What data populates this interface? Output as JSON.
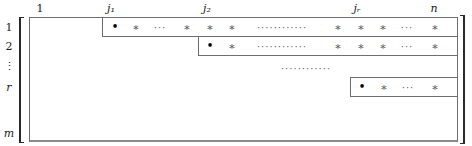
{
  "diagram": {
    "type": "row-echelon-form-matrix",
    "column_labels": [
      {
        "text": "1",
        "x": 40
      },
      {
        "text": "j₁",
        "x": 111
      },
      {
        "text": "j₂",
        "x": 207
      },
      {
        "text": "jᵣ",
        "x": 357
      },
      {
        "text": "n",
        "x": 434
      }
    ],
    "row_labels": [
      {
        "text": "1",
        "y": 27
      },
      {
        "text": "2",
        "y": 46
      },
      {
        "text": "⋮",
        "y": 66
      },
      {
        "text": "r",
        "y": 87
      },
      {
        "text": "m",
        "y": 133
      }
    ],
    "rows": [
      {
        "name": "row-1",
        "box": {
          "x": 102,
          "y": 17,
          "w": 355,
          "h": 19
        },
        "cells": [
          {
            "kind": "pivot",
            "text": "•",
            "x": 115
          },
          {
            "kind": "star",
            "text": "∗",
            "x": 136
          },
          {
            "kind": "dots",
            "text": "···",
            "x": 160
          },
          {
            "kind": "star",
            "text": "∗",
            "x": 187
          },
          {
            "kind": "star",
            "text": "∗",
            "x": 210
          },
          {
            "kind": "star",
            "text": "∗",
            "x": 232
          },
          {
            "kind": "dots",
            "text": "············",
            "x": 282
          },
          {
            "kind": "star",
            "text": "∗",
            "x": 338
          },
          {
            "kind": "star",
            "text": "∗",
            "x": 361
          },
          {
            "kind": "star",
            "text": "∗",
            "x": 383
          },
          {
            "kind": "dots",
            "text": "···",
            "x": 407
          },
          {
            "kind": "star",
            "text": "∗",
            "x": 435
          }
        ]
      },
      {
        "name": "row-2",
        "box": {
          "x": 198,
          "y": 36,
          "w": 259,
          "h": 19
        },
        "cells": [
          {
            "kind": "pivot",
            "text": "•",
            "x": 210
          },
          {
            "kind": "star",
            "text": "∗",
            "x": 232
          },
          {
            "kind": "dots",
            "text": "············",
            "x": 282
          },
          {
            "kind": "star",
            "text": "∗",
            "x": 338
          },
          {
            "kind": "star",
            "text": "∗",
            "x": 361
          },
          {
            "kind": "star",
            "text": "∗",
            "x": 383
          },
          {
            "kind": "dots",
            "text": "···",
            "x": 407
          },
          {
            "kind": "star",
            "text": "∗",
            "x": 435
          }
        ]
      },
      {
        "name": "row-r",
        "box": {
          "x": 350,
          "y": 77,
          "w": 107,
          "h": 19
        },
        "cells": [
          {
            "kind": "pivot",
            "text": "•",
            "x": 362
          },
          {
            "kind": "star",
            "text": "∗",
            "x": 384
          },
          {
            "kind": "dots",
            "text": "···",
            "x": 408
          },
          {
            "kind": "star",
            "text": "∗",
            "x": 435
          }
        ]
      }
    ],
    "middle_dots": {
      "text": "············",
      "x": 306,
      "y": 68
    },
    "colors": {
      "line": "#6e6e6e",
      "bracket": "#2a2a2a",
      "pivot": "#000000",
      "entry": "#555555"
    }
  }
}
